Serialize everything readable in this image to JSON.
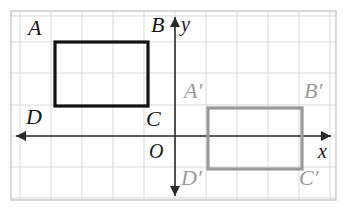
{
  "figure": {
    "type": "geometry-diagram",
    "canvas": {
      "width": 348,
      "height": 211
    },
    "frame": {
      "x": 11,
      "y": 11,
      "width": 325,
      "height": 189,
      "stroke": "#c9c9c9"
    },
    "colors": {
      "background": "#ffffff",
      "grid": "#d9d9d9",
      "frame": "#c9c9c9",
      "axis": "#2b2b2b",
      "preimage": "#111111",
      "image": "#9a9a9a",
      "label_dark": "#151515",
      "label_gray": "#9a9a9a"
    },
    "grid": {
      "visible": true,
      "cell_size": 31,
      "x_lines": [
        20,
        51,
        82,
        113,
        144,
        175,
        206,
        237,
        268,
        299,
        330
      ],
      "y_lines": [
        16,
        42,
        73,
        105,
        136,
        167,
        198
      ]
    },
    "axes": {
      "x_axis": {
        "label": "x",
        "y_pixel": 136,
        "x_start": 16,
        "x_end": 331,
        "arrow_left": true,
        "arrow_right": true
      },
      "y_axis": {
        "label": "y",
        "x_pixel": 175,
        "y_start": 17,
        "y_end": 196,
        "arrow_up": true,
        "arrow_down": true
      },
      "origin_label": "O"
    },
    "shapes": [
      {
        "name": "preimage-rectangle",
        "vertices": "ABCD",
        "stroke": "#111111",
        "stroke_width": 3.2,
        "fill": "none",
        "x": 55,
        "y": 42,
        "width": 93,
        "height": 64
      },
      {
        "name": "image-rectangle",
        "vertices": "A'B'C'D'",
        "stroke": "#9a9a9a",
        "stroke_width": 3.2,
        "fill": "none",
        "x": 208,
        "y": 108,
        "width": 94,
        "height": 61
      }
    ],
    "labels": {
      "A": {
        "text": "A",
        "x": 28,
        "y": 17,
        "style": "dark"
      },
      "B": {
        "text": "B",
        "x": 151,
        "y": 14,
        "style": "dark"
      },
      "C": {
        "text": "C",
        "x": 146,
        "y": 108,
        "style": "dark"
      },
      "D": {
        "text": "D",
        "x": 26,
        "y": 106,
        "style": "dark"
      },
      "Ap": {
        "text": "A′",
        "x": 184,
        "y": 80,
        "style": "gray"
      },
      "Bp": {
        "text": "B′",
        "x": 304,
        "y": 80,
        "style": "gray"
      },
      "Cp": {
        "text": "C′",
        "x": 299,
        "y": 167,
        "style": "gray"
      },
      "Dp": {
        "text": "D′",
        "x": 181,
        "y": 167,
        "style": "gray"
      },
      "O": {
        "text": "O",
        "x": 149,
        "y": 141,
        "style": "dark"
      },
      "x": {
        "text": "x",
        "x": 318,
        "y": 141,
        "style": "dark"
      },
      "y": {
        "text": "y",
        "x": 181,
        "y": 14,
        "style": "dark"
      }
    }
  }
}
